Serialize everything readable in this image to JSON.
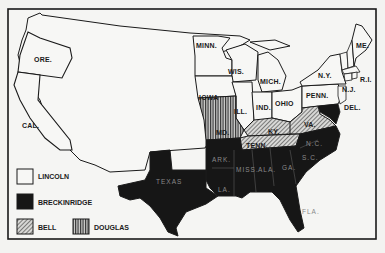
{
  "map": {
    "subject": "1860 U.S. presidential election results by state",
    "colors": {
      "background": "#f3f3f1",
      "lincoln": "#f7f7f5",
      "breckinridge": "#161616",
      "bell_hatch": "#8a8a8a",
      "douglas_hatch": "#6a6a6a",
      "border": "#1a1a1a"
    },
    "state_labels": {
      "ore": "ORE.",
      "cal": "CAL.",
      "minn": "MINN.",
      "wis": "WIS.",
      "mich": "MICH.",
      "iowa": "IOWA",
      "ill": "ILL.",
      "ind": "IND.",
      "ohio": "OHIO",
      "penn": "PENN.",
      "ny": "N.Y.",
      "vt": "VT.",
      "nh": "N.H.",
      "me": "ME.",
      "mass": "MASS.",
      "conn": "CT.",
      "ri": "R.I.",
      "nj": "N.J.",
      "del": "DEL.",
      "md": "MD.",
      "mo": "MO.",
      "ky": "KY.",
      "va": "VA.",
      "tenn": "TENN.",
      "nc": "N.C.",
      "sc": "S.C.",
      "ark": "ARK.",
      "miss": "MISS.",
      "ala": "ALA.",
      "ga": "GA.",
      "la": "LA.",
      "fla": "FLA.",
      "texas": "TEXAS"
    },
    "legend": [
      {
        "key": "lincoln",
        "label": "LINCOLN",
        "pattern": "white"
      },
      {
        "key": "breckinridge",
        "label": "BRECKINRIDGE",
        "pattern": "black"
      },
      {
        "key": "bell",
        "label": "BELL",
        "pattern": "diagonal-hatch"
      },
      {
        "key": "douglas",
        "label": "DOUGLAS",
        "pattern": "vertical-hatch"
      }
    ]
  }
}
